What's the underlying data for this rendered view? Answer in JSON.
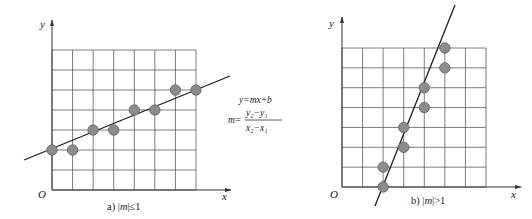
{
  "colors": {
    "grid": "#5a5a5a",
    "axis": "#333333",
    "line": "#1e1e1e",
    "point_fill": "#8c8c8c",
    "point_stroke": "#5e5e5e",
    "text": "#222222"
  },
  "panels": [
    {
      "id": "a",
      "caption": "a) |m|≤1",
      "caption_prefix": "a) |",
      "caption_var": "m",
      "caption_suffix": "|≤1",
      "axis_labels": {
        "x": "x",
        "y": "y",
        "origin": "O"
      },
      "grid": {
        "cols": 7,
        "rows": 7
      },
      "points": [
        [
          0,
          2
        ],
        [
          1,
          2
        ],
        [
          2,
          3
        ],
        [
          3,
          3
        ],
        [
          4,
          4
        ],
        [
          5,
          4
        ],
        [
          6,
          5
        ],
        [
          7,
          5
        ]
      ]
    },
    {
      "id": "b",
      "caption": "b) |m|>1",
      "caption_prefix": "b) |",
      "caption_var": "m",
      "caption_suffix": "|>1",
      "axis_labels": {
        "x": "x",
        "y": "y",
        "origin": "O"
      },
      "grid": {
        "cols": 7,
        "rows": 7
      },
      "points": [
        [
          2,
          0
        ],
        [
          2,
          1
        ],
        [
          3,
          2
        ],
        [
          3,
          3
        ],
        [
          4,
          4
        ],
        [
          4,
          5
        ],
        [
          5,
          6
        ],
        [
          5,
          7
        ]
      ]
    }
  ],
  "formula": {
    "line1": "y=mx+b",
    "m_label": "m=",
    "numerator": "y₂−y₁",
    "denominator": "x₂−x₁"
  }
}
